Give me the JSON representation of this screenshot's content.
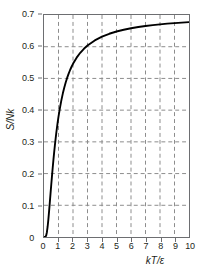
{
  "chart_data": {
    "type": "line",
    "title": "",
    "xlabel": "kT/ε",
    "ylabel": "S/Nk",
    "xlim": [
      0,
      10
    ],
    "ylim": [
      0,
      0.7
    ],
    "grid": true,
    "legend": "none",
    "x_ticks": [
      0,
      1,
      2,
      3,
      4,
      5,
      6,
      7,
      8,
      9,
      10
    ],
    "x_tick_labels": [
      "0",
      "1",
      "2",
      "3",
      "4",
      "5",
      "6",
      "7",
      "8",
      "9",
      "10"
    ],
    "y_ticks": [
      0,
      0.1,
      0.2,
      0.3,
      0.4,
      0.5,
      0.6,
      0.7
    ],
    "y_tick_labels": [
      "0",
      "0.1",
      "0.2",
      "0.3",
      "0.4",
      "0.5",
      "0.6",
      "0.7"
    ],
    "series": [
      {
        "name": "two-level system entropy",
        "color": "#000000",
        "x": [
          0.0,
          0.05,
          0.1,
          0.15,
          0.2,
          0.25,
          0.3,
          0.35,
          0.4,
          0.45,
          0.5,
          0.55,
          0.6,
          0.65,
          0.7,
          0.75,
          0.8,
          0.85,
          0.9,
          0.95,
          1.0,
          1.1,
          1.2,
          1.3,
          1.4,
          1.5,
          1.6,
          1.7,
          1.8,
          1.9,
          2.0,
          2.25,
          2.5,
          2.75,
          3.0,
          3.5,
          4.0,
          4.5,
          5.0,
          5.5,
          6.0,
          6.5,
          7.0,
          7.5,
          8.0,
          8.5,
          9.0,
          9.5,
          10.0
        ],
        "y": [
          0.0,
          0.0,
          0.0005,
          0.0045,
          0.0151,
          0.0324,
          0.0549,
          0.0808,
          0.1085,
          0.1368,
          0.1648,
          0.1921,
          0.2183,
          0.2432,
          0.2667,
          0.2888,
          0.3095,
          0.3288,
          0.3468,
          0.3636,
          0.3793,
          0.4073,
          0.4317,
          0.453,
          0.4716,
          0.488,
          0.5024,
          0.5152,
          0.5266,
          0.5368,
          0.546,
          0.5654,
          0.5808,
          0.5934,
          0.6038,
          0.6199,
          0.6318,
          0.6408,
          0.6479,
          0.6536,
          0.6583,
          0.6622,
          0.6654,
          0.6682,
          0.6706,
          0.6727,
          0.6745,
          0.6761,
          0.6776
        ]
      }
    ],
    "asymptote": 0.6931
  },
  "axes": {
    "y_title": "S/Nk",
    "x_title": "kT/ε"
  }
}
